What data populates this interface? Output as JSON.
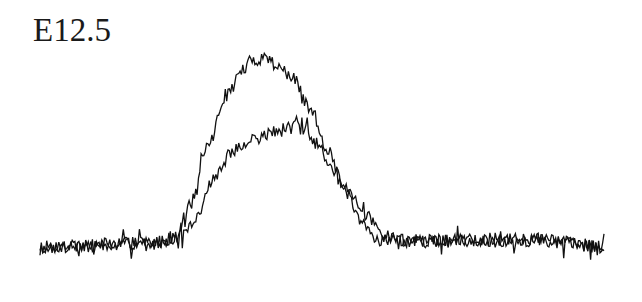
{
  "figure": {
    "title": "E12.5",
    "background": "#ffffff",
    "line_color": "#111111"
  },
  "chart_data": {
    "type": "line",
    "title": "E12.5",
    "xlabel": "",
    "ylabel": "",
    "grid": false,
    "axes_visible": false,
    "legend": null,
    "note": "Two overlaid noisy intensity profiles with a single peak; no axes or tick labels shown. Values expressed in relative units (0 = baseline, 1 = tallest peak), x in relative position 0–100.",
    "x_range": [
      0,
      100
    ],
    "y_range": [
      0,
      1
    ],
    "series": [
      {
        "name": "profile-1 (tall peak)",
        "anchors_x": [
          0,
          20,
          24,
          27,
          30,
          33,
          36,
          37.5,
          40,
          42,
          45,
          48,
          51,
          54,
          57,
          60,
          70,
          80,
          90,
          100
        ],
        "anchors_y": [
          0.0,
          0.02,
          0.05,
          0.25,
          0.55,
          0.8,
          0.93,
          0.98,
          1.0,
          0.96,
          0.88,
          0.72,
          0.52,
          0.3,
          0.12,
          0.04,
          0.03,
          0.04,
          0.03,
          0.0
        ],
        "noise": 0.035,
        "seed": 7
      },
      {
        "name": "profile-2 (lower peak)",
        "anchors_x": [
          0,
          20,
          25,
          28,
          31,
          34,
          38,
          42,
          45,
          46.5,
          49,
          52,
          55,
          58,
          61,
          64,
          70,
          80,
          90,
          100
        ],
        "anchors_y": [
          0.0,
          0.02,
          0.05,
          0.16,
          0.38,
          0.5,
          0.57,
          0.61,
          0.63,
          0.62,
          0.55,
          0.42,
          0.28,
          0.16,
          0.08,
          0.03,
          0.04,
          0.03,
          0.04,
          0.0
        ],
        "noise": 0.035,
        "seed": 19
      }
    ]
  },
  "layout_px": {
    "x0": 40,
    "x1": 604,
    "baseline_y": 247,
    "peak_y": 57,
    "samples": 420
  }
}
